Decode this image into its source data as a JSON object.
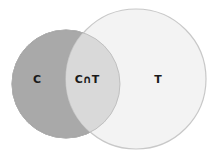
{
  "diagram": {
    "type": "venn",
    "sets": [
      {
        "id": "C",
        "label": "C",
        "fill": "#a9a9a9",
        "stroke": "#8f8f8f"
      },
      {
        "id": "T",
        "label": "T",
        "fill": "#f3f3f3",
        "stroke": "#c8c8c8"
      }
    ],
    "intersection": {
      "label": "C∩T",
      "fill": "#d9d9d9"
    }
  }
}
